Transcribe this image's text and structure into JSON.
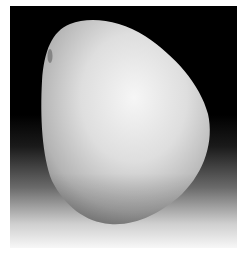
{
  "image": {
    "subject": "white pebble stone",
    "alt": "Photograph of a smooth white pebble on a dark-to-light gradient background",
    "colors": {
      "background_top": "#000000",
      "background_bottom": "#f7f7f7",
      "stone_highlight": "#f4f4f4",
      "stone_shadow": "#8e8e8e"
    }
  }
}
